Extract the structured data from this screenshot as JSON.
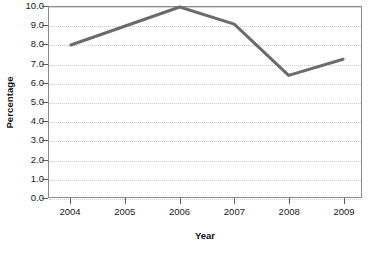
{
  "chart_data": {
    "type": "line",
    "title": "",
    "subtitle": "",
    "xlabel": "Year",
    "ylabel": "Percentage",
    "categories": [
      "2004",
      "2005",
      "2006",
      "2007",
      "2008",
      "2009"
    ],
    "x": [
      2004,
      2005,
      2006,
      2007,
      2008,
      2009
    ],
    "values": [
      8.0,
      9.0,
      10.0,
      9.1,
      6.4,
      7.25
    ],
    "series": [
      {
        "name": "Percentage",
        "values": [
          8.0,
          9.0,
          10.0,
          9.1,
          6.4,
          7.25
        ]
      }
    ],
    "ylim": [
      0.0,
      10.0
    ],
    "ytick_step": 1.0,
    "ytick_labels": [
      "10.0",
      "9.0",
      "8.0",
      "7.0",
      "6.0",
      "5.0",
      "4.0",
      "3.0",
      "2.0",
      "1.0",
      "0.0"
    ],
    "ytick_values": [
      10.0,
      9.0,
      8.0,
      7.0,
      6.0,
      5.0,
      4.0,
      3.0,
      2.0,
      1.0,
      0.0
    ],
    "xtick_labels": [
      "2004",
      "2005",
      "2006",
      "2007",
      "2008",
      "2009"
    ],
    "grid": true,
    "grid_axis": "y",
    "legend": false,
    "legend_position": "none",
    "annotations": [],
    "line_color": "#6b6b6b",
    "line_width": 3,
    "marker": "none",
    "background_color": "#ffffff",
    "gridline_color": "#d8d8d8",
    "axis_color": "#8a8a8a",
    "text_color": "#1a1a1a"
  }
}
